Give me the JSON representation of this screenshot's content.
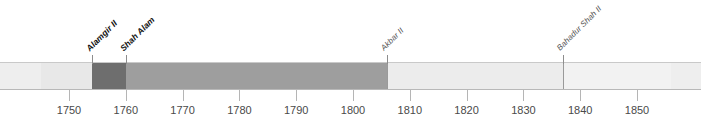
{
  "chart_data": {
    "type": "timeline",
    "title": "",
    "xlabel": "",
    "ylabel": "",
    "xlim": [
      1745,
      1856
    ],
    "grid": false,
    "legend": "none",
    "axis": {
      "tick_values": [
        1750,
        1760,
        1770,
        1780,
        1790,
        1800,
        1810,
        1820,
        1830,
        1840,
        1850
      ],
      "tick_labels": [
        "1750",
        "1760",
        "1770",
        "1780",
        "1790",
        "1800",
        "1810",
        "1820",
        "1830",
        "1840",
        "1850"
      ]
    },
    "segments": [
      {
        "name": "",
        "label": "",
        "start": 1745,
        "end": 1754,
        "color": "#e8e8e8",
        "label_style": "none"
      },
      {
        "name": "alamgir-ii",
        "label": "Alamgir II",
        "start": 1754,
        "end": 1760,
        "color": "#6e6e6e",
        "label_style": "strong"
      },
      {
        "name": "shah-alam",
        "label": "Shah Alam",
        "start": 1760,
        "end": 1806,
        "color": "#9e9e9e",
        "label_style": "strong"
      },
      {
        "name": "akbar-ii",
        "label": "Akbar II",
        "start": 1806,
        "end": 1837,
        "color": "#ececec",
        "label_style": "light"
      },
      {
        "name": "bahadur-shah-ii",
        "label": "Bahadur Shah II",
        "start": 1837,
        "end": 1856,
        "color": "#f2f2f2",
        "label_style": "light"
      }
    ]
  },
  "colors": {
    "band_background": "#eeeeee",
    "band_border_top": "#c9c9c9",
    "band_border_bottom": "#b8b8b8",
    "tick": "#b5b5b5",
    "tick_label": "#4a4a4a",
    "divider": "#9a9a9a",
    "leader": "#8d8d8d",
    "page_background": "#ffffff"
  }
}
